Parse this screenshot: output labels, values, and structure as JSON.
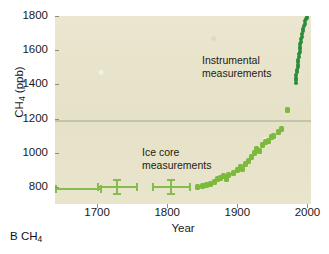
{
  "caption": {
    "panel_letter": "B",
    "species": "CH",
    "species_sub": "4"
  },
  "chart_data": {
    "type": "scatter",
    "title": "",
    "xlabel": "Year",
    "ylabel_text": "CH",
    "ylabel_sub": "4",
    "ylabel_units": " (ppb)",
    "xlim": [
      1640,
      2005
    ],
    "ylim": [
      700,
      1800
    ],
    "xticks": [
      1700,
      1800,
      1900,
      2000
    ],
    "yticks": [
      800,
      1000,
      1200,
      1400,
      1600,
      1800
    ],
    "grid": true,
    "gridlines_y": [
      1190
    ],
    "legend_position": "none",
    "annotations": [
      {
        "text_line1": "Instrumental",
        "text_line2": "measurements",
        "x": 1930,
        "y": 1640
      },
      {
        "text_line1": "Ice core",
        "text_line2": "measurements",
        "x": 1790,
        "y": 1060
      }
    ],
    "colors": {
      "ice_core": "#7cba3d",
      "instrumental": "#2a8c3b",
      "plot_background": "#e8e4cc",
      "gridline": "#a8aa96",
      "axis_text": "#1a1a1a"
    },
    "series": [
      {
        "name": "Ice core measurements",
        "marker": "square",
        "color": "#7cba3d",
        "points": [
          {
            "x": 1843,
            "y": 800
          },
          {
            "x": 1850,
            "y": 805
          },
          {
            "x": 1856,
            "y": 812
          },
          {
            "x": 1862,
            "y": 818
          },
          {
            "x": 1868,
            "y": 826
          },
          {
            "x": 1872,
            "y": 845
          },
          {
            "x": 1876,
            "y": 855
          },
          {
            "x": 1880,
            "y": 862
          },
          {
            "x": 1884,
            "y": 845
          },
          {
            "x": 1888,
            "y": 870
          },
          {
            "x": 1894,
            "y": 880
          },
          {
            "x": 1900,
            "y": 900
          },
          {
            "x": 1904,
            "y": 918
          },
          {
            "x": 1908,
            "y": 905
          },
          {
            "x": 1912,
            "y": 935
          },
          {
            "x": 1916,
            "y": 950
          },
          {
            "x": 1920,
            "y": 975
          },
          {
            "x": 1924,
            "y": 1000
          },
          {
            "x": 1928,
            "y": 1020
          },
          {
            "x": 1932,
            "y": 1010
          },
          {
            "x": 1936,
            "y": 1045
          },
          {
            "x": 1940,
            "y": 1065
          },
          {
            "x": 1944,
            "y": 1070
          },
          {
            "x": 1948,
            "y": 1090
          },
          {
            "x": 1952,
            "y": 1100
          },
          {
            "x": 1958,
            "y": 1120
          },
          {
            "x": 1963,
            "y": 1140
          },
          {
            "x": 1972,
            "y": 1250
          }
        ]
      },
      {
        "name": "Instrumental measurements",
        "marker": "circle",
        "color": "#2a8c3b",
        "description": "Dense near-vertical cluster of annual values rising steeply",
        "points": [
          {
            "x": 1983,
            "y": 1410
          },
          {
            "x": 1983,
            "y": 1425
          },
          {
            "x": 1984,
            "y": 1440
          },
          {
            "x": 1984,
            "y": 1455
          },
          {
            "x": 1985,
            "y": 1470
          },
          {
            "x": 1985,
            "y": 1485
          },
          {
            "x": 1986,
            "y": 1500
          },
          {
            "x": 1986,
            "y": 1515
          },
          {
            "x": 1987,
            "y": 1530
          },
          {
            "x": 1987,
            "y": 1545
          },
          {
            "x": 1988,
            "y": 1560
          },
          {
            "x": 1988,
            "y": 1575
          },
          {
            "x": 1989,
            "y": 1590
          },
          {
            "x": 1989,
            "y": 1605
          },
          {
            "x": 1990,
            "y": 1620
          },
          {
            "x": 1990,
            "y": 1635
          },
          {
            "x": 1991,
            "y": 1650
          },
          {
            "x": 1991,
            "y": 1665
          },
          {
            "x": 1992,
            "y": 1680
          },
          {
            "x": 1992,
            "y": 1695
          },
          {
            "x": 1993,
            "y": 1710
          },
          {
            "x": 1994,
            "y": 1725
          },
          {
            "x": 1995,
            "y": 1740
          },
          {
            "x": 1996,
            "y": 1755
          },
          {
            "x": 1997,
            "y": 1768
          },
          {
            "x": 1998,
            "y": 1780
          },
          {
            "x": 1999,
            "y": 1790
          },
          {
            "x": 2000,
            "y": 1798
          }
        ]
      },
      {
        "name": "Ice core measurements with error bars",
        "marker": "cross-errorbar",
        "color": "#86bb4e",
        "points": [
          {
            "x": 1672,
            "y": 785,
            "xerr": 32,
            "yerr": 0
          },
          {
            "x": 1728,
            "y": 800,
            "xerr": 28,
            "yerr": 42
          },
          {
            "x": 1805,
            "y": 800,
            "xerr": 26,
            "yerr": 42
          }
        ]
      }
    ]
  }
}
